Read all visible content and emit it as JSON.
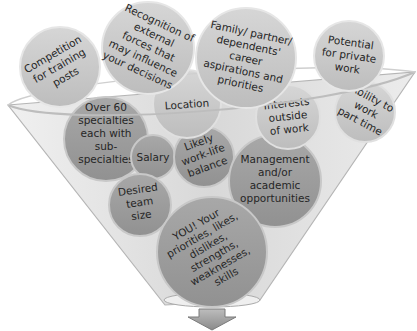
{
  "diagram": {
    "type": "funnel",
    "colors": {
      "bubble_top": "#c9c9c9",
      "bubble_bottom": "#999999",
      "funnel_glass": "#e2e2e2",
      "funnel_edge": "#b5b5b5",
      "arrow": "#9a9a9a",
      "text": "#262626"
    },
    "bubbles": [
      {
        "id": "competition",
        "lines": [
          "Competition",
          "for training",
          "posts"
        ]
      },
      {
        "id": "recognition",
        "lines": [
          "Recognition of",
          "external",
          "forces that",
          "may influence",
          "your decisions"
        ]
      },
      {
        "id": "family",
        "lines": [
          "Family/ partner/",
          "dependents'",
          "career",
          "aspirations and",
          "priorities"
        ]
      },
      {
        "id": "private",
        "lines": [
          "Potential",
          "for private",
          "work"
        ]
      },
      {
        "id": "specialties",
        "lines": [
          "Over 60",
          "specialties",
          "each with",
          "sub-",
          "specialties"
        ]
      },
      {
        "id": "location",
        "lines": [
          "Location"
        ]
      },
      {
        "id": "interests",
        "lines": [
          "Interests",
          "outside",
          "of work"
        ]
      },
      {
        "id": "parttime",
        "lines": [
          "Ability to",
          "work",
          "part time"
        ]
      },
      {
        "id": "salary",
        "lines": [
          "Salary"
        ]
      },
      {
        "id": "worklife",
        "lines": [
          "Likely",
          "work-life",
          "balance"
        ]
      },
      {
        "id": "management",
        "lines": [
          "Management",
          "and/or",
          "academic",
          "opportunities"
        ]
      },
      {
        "id": "team",
        "lines": [
          "Desired",
          "team",
          "size"
        ]
      },
      {
        "id": "you",
        "lines": [
          "YOU! Your",
          "priorities, likes,",
          "dislikes,",
          "strengths,",
          "weaknesses,",
          "skills"
        ]
      }
    ],
    "output_arrow": "down-arrow"
  }
}
